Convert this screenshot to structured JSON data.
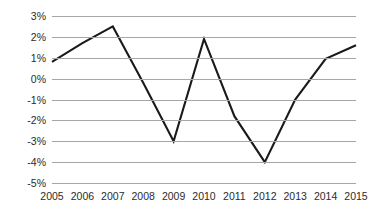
{
  "chart_data": {
    "type": "line",
    "title": "",
    "subtitle": "",
    "xlabel": "",
    "ylabel": "",
    "categories": [
      "2005",
      "2006",
      "2007",
      "2008",
      "2009",
      "2010",
      "2011",
      "2012",
      "2013",
      "2014",
      "2015"
    ],
    "values": [
      0.8,
      1.7,
      2.5,
      -0.2,
      -3.0,
      1.9,
      -1.8,
      -4.0,
      -1.0,
      0.95,
      1.6
    ],
    "series": [
      {
        "name": "",
        "values": [
          0.8,
          1.7,
          2.5,
          -0.2,
          -3.0,
          1.9,
          -1.8,
          -4.0,
          -1.0,
          0.95,
          1.6
        ]
      }
    ],
    "y_tick_labels": [
      "3%",
      "2%",
      "1%",
      "0%",
      "-1%",
      "-2%",
      "-3%",
      "-4%",
      "-5%"
    ],
    "y_tick_values": [
      3,
      2,
      1,
      0,
      -1,
      -2,
      -3,
      -4,
      -5
    ],
    "x_tick_labels": [
      "2005",
      "2006",
      "2007",
      "2008",
      "2009",
      "2010",
      "2011",
      "2012",
      "2013",
      "2014",
      "2015"
    ],
    "ylim": [
      -5,
      3
    ],
    "grid": "horizontal",
    "legend": "none",
    "annotations": [],
    "colors": {
      "line": "#1a1a1a",
      "gridline": "#a6a6a6",
      "background": "#ffffff",
      "tick_text": "#2b2b2b"
    },
    "line_width": 2.1
  }
}
